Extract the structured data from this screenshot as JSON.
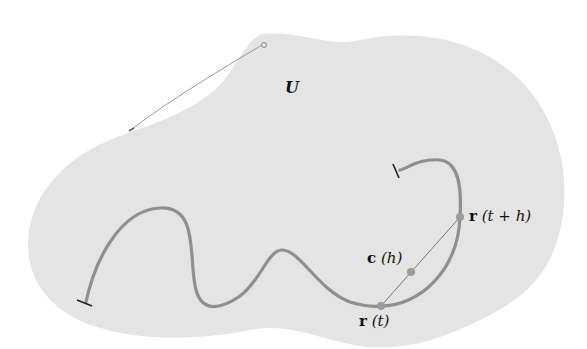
{
  "diagram": {
    "colors": {
      "region_fill": "#e4e4e4",
      "curve": "#8f8f8f",
      "point": "#9a9a9a",
      "chord": "#7a7a7a",
      "text": "#111111"
    },
    "region": {
      "label": "U"
    },
    "curve": {
      "description": "smooth path r in region U with two endpoints"
    },
    "points": [
      {
        "id": "r_t",
        "label_bold": "r",
        "label_arg": "(t)"
      },
      {
        "id": "r_t_plus_h",
        "label_bold": "r",
        "label_arg": "(t + h)"
      },
      {
        "id": "c_h",
        "label_bold": "c",
        "label_arg": "(h)"
      }
    ]
  }
}
